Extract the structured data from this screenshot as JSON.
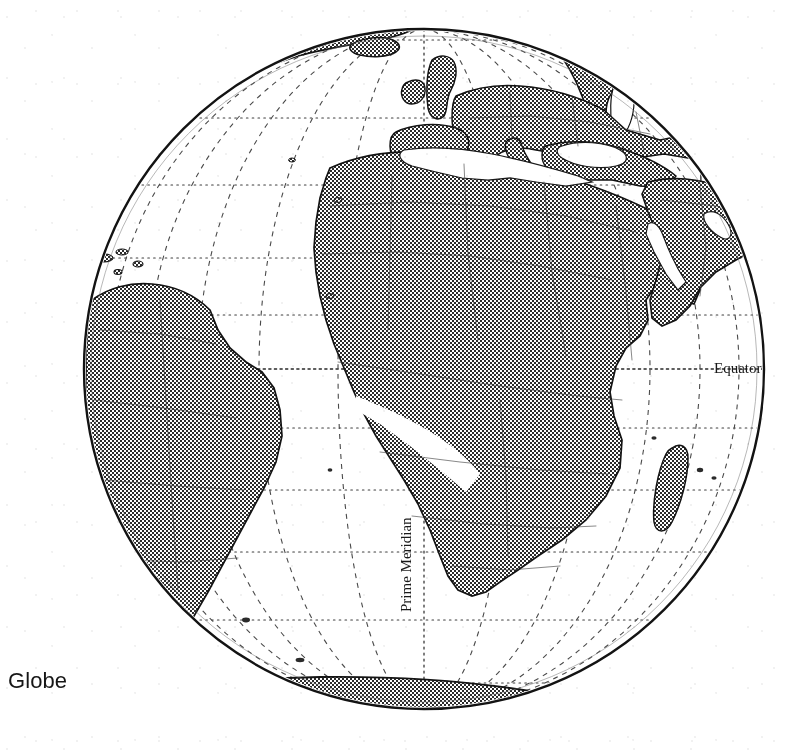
{
  "figure": {
    "caption": "Globe",
    "title": "Globe",
    "projection": "orthographic",
    "background_color": "#ffffff",
    "ink_color": "#1a1a1a",
    "land_fill_color": "#8a8a8a",
    "ocean_fill_color": "#ffffff"
  },
  "globe": {
    "center_x": 424,
    "center_y": 369,
    "radius": 341,
    "outline_color": "#1a1a1a",
    "outline_width": 2.2,
    "center_longitude": 10,
    "center_latitude": 8
  },
  "graticule": {
    "latitude_step_degrees": 15,
    "longitude_step_degrees": 15,
    "latitude_line_style": "dotted",
    "longitude_line_style": "dashed",
    "line_color": "#4a4a4a",
    "latitude_labels": [
      75,
      60,
      45,
      30,
      15,
      0,
      -15,
      -30,
      -45,
      -60,
      -75
    ],
    "longitude_labels": [
      -90,
      -75,
      -60,
      -45,
      -30,
      -15,
      0,
      15,
      30,
      45,
      60,
      75,
      90
    ]
  },
  "labels": {
    "equator": {
      "text": "Equator",
      "x": 714,
      "y": 373,
      "font_size": 15,
      "rotation": 0
    },
    "prime_meridian": {
      "text": "Prime Meridian",
      "x": 411,
      "y": 612,
      "font_size": 15,
      "rotation": -90
    }
  },
  "continents": [
    {
      "name": "Africa",
      "visible": true
    },
    {
      "name": "Europe",
      "visible": true
    },
    {
      "name": "South America",
      "visible": true
    },
    {
      "name": "Greenland",
      "visible": true
    },
    {
      "name": "Iceland",
      "visible": true
    },
    {
      "name": "British Isles",
      "visible": true
    },
    {
      "name": "Scandinavia",
      "visible": true
    },
    {
      "name": "Arabian Peninsula",
      "visible": true
    },
    {
      "name": "Madagascar",
      "visible": true
    },
    {
      "name": "Antarctica",
      "visible": true
    },
    {
      "name": "Middle East",
      "visible": true
    }
  ],
  "seas": [
    {
      "name": "Mediterranean Sea",
      "visible": true
    },
    {
      "name": "Black Sea",
      "visible": true
    },
    {
      "name": "Caspian Sea",
      "visible": true
    },
    {
      "name": "Red Sea",
      "visible": true
    },
    {
      "name": "Persian Gulf",
      "visible": true
    },
    {
      "name": "Atlantic Ocean",
      "visible": true
    },
    {
      "name": "Indian Ocean",
      "visible": true
    }
  ]
}
